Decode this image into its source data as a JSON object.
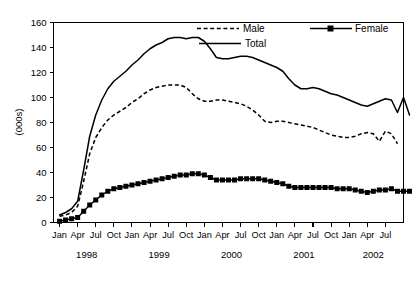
{
  "chart_data": {
    "type": "line",
    "title": "",
    "xlabel": "",
    "ylabel": "(000s)",
    "ylim": [
      0,
      160
    ],
    "yticks": [
      0,
      20,
      40,
      60,
      80,
      100,
      120,
      140,
      160
    ],
    "grid": false,
    "legend_position": "top-center",
    "x_tick_labels": [
      "Jan",
      "Apr",
      "Jul",
      "Oct",
      "Jan",
      "Apr",
      "Jul",
      "Oct",
      "Jan",
      "Apr",
      "Jul",
      "Oct",
      "Jan",
      "Apr",
      "Jul",
      "Oct",
      "Jan",
      "Apr",
      "Jul"
    ],
    "year_labels": [
      "1998",
      "1999",
      "2000",
      "2001",
      "2002"
    ],
    "x_months": [
      "Jan 1998",
      "Feb 1998",
      "Mar 1998",
      "Apr 1998",
      "May 1998",
      "Jun 1998",
      "Jul 1998",
      "Aug 1998",
      "Sep 1998",
      "Oct 1998",
      "Nov 1998",
      "Dec 1998",
      "Jan 1999",
      "Feb 1999",
      "Mar 1999",
      "Apr 1999",
      "May 1999",
      "Jun 1999",
      "Jul 1999",
      "Aug 1999",
      "Sep 1999",
      "Oct 1999",
      "Nov 1999",
      "Dec 1999",
      "Jan 2000",
      "Feb 2000",
      "Mar 2000",
      "Apr 2000",
      "May 2000",
      "Jun 2000",
      "Jul 2000",
      "Aug 2000",
      "Sep 2000",
      "Oct 2000",
      "Nov 2000",
      "Dec 2000",
      "Jan 2001",
      "Feb 2001",
      "Mar 2001",
      "Apr 2001",
      "May 2001",
      "Jun 2001",
      "Jul 2001",
      "Aug 2001",
      "Sep 2001",
      "Oct 2001",
      "Nov 2001",
      "Dec 2001",
      "Jan 2002",
      "Feb 2002",
      "Mar 2002",
      "Apr 2002",
      "May 2002",
      "Jun 2002",
      "Jul 2002",
      "Aug 2002",
      "Sep 2002"
    ],
    "series": [
      {
        "name": "Male",
        "style": "dashed",
        "marker": "none",
        "color": "#000000",
        "values": [
          5,
          6,
          8,
          13,
          33,
          55,
          68,
          76,
          82,
          86,
          89,
          92,
          96,
          99,
          103,
          106,
          108,
          109,
          110,
          110,
          110,
          108,
          103,
          99,
          97,
          97,
          98,
          98,
          97,
          96,
          95,
          93,
          90,
          86,
          81,
          80,
          81,
          81,
          80,
          79,
          78,
          77,
          76,
          74,
          72,
          70,
          69,
          68,
          68,
          69,
          71,
          72,
          71,
          65,
          73,
          71,
          63
        ]
      },
      {
        "name": "Female",
        "style": "solid",
        "marker": "square",
        "color": "#000000",
        "values": [
          1,
          2,
          3,
          4,
          9,
          14,
          18,
          22,
          25,
          27,
          28,
          29,
          30,
          31,
          32,
          33,
          34,
          35,
          36,
          37,
          38,
          38,
          39,
          39,
          38,
          36,
          34,
          34,
          34,
          34,
          35,
          35,
          35,
          35,
          34,
          33,
          32,
          31,
          29,
          28,
          28,
          28,
          28,
          28,
          28,
          28,
          27,
          27,
          27,
          26,
          25,
          24,
          25,
          26,
          26,
          27,
          25,
          25,
          25
        ]
      },
      {
        "name": "Total",
        "style": "solid",
        "marker": "none",
        "color": "#000000",
        "values": [
          6,
          8,
          11,
          17,
          42,
          69,
          86,
          98,
          107,
          113,
          117,
          121,
          126,
          130,
          135,
          139,
          142,
          144,
          147,
          148,
          148,
          147,
          148,
          148,
          145,
          139,
          132,
          131,
          131,
          132,
          133,
          133,
          132,
          130,
          128,
          126,
          124,
          121,
          115,
          110,
          107,
          107,
          108,
          107,
          105,
          103,
          102,
          100,
          98,
          96,
          94,
          93,
          95,
          97,
          99,
          98,
          88,
          100,
          86
        ]
      }
    ]
  },
  "legend": {
    "items": [
      {
        "label": "Male"
      },
      {
        "label": "Female"
      },
      {
        "label": "Total"
      }
    ]
  }
}
